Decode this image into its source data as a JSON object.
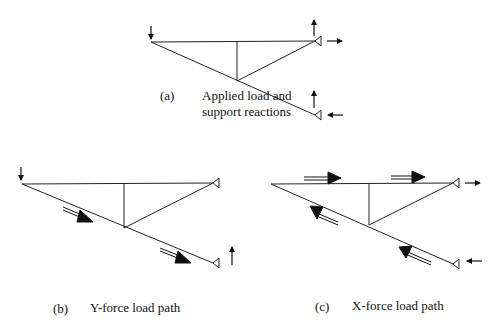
{
  "figures": {
    "a": {
      "label": "(a)",
      "caption_line1": "Applied load and",
      "caption_line2": "support reactions"
    },
    "b": {
      "label": "(b)",
      "caption": "Y-force load path"
    },
    "c": {
      "label": "(c)",
      "caption": "X-force load path"
    }
  }
}
